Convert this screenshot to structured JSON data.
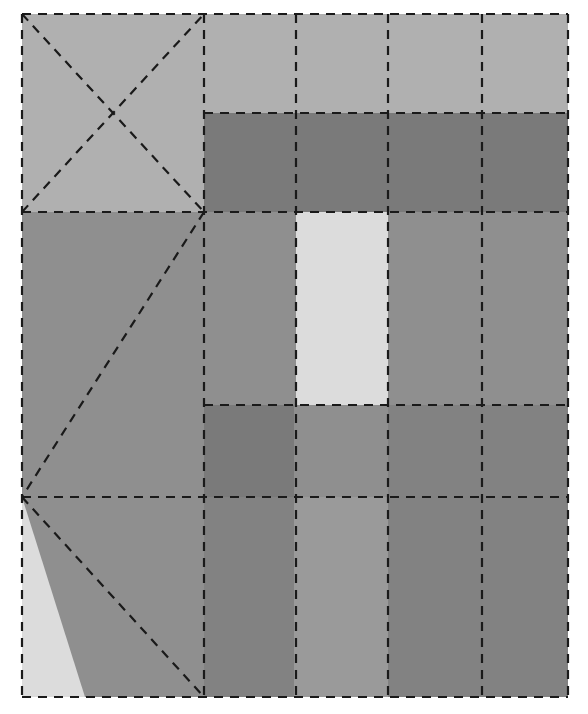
{
  "canvas": {
    "width": 588,
    "height": 714,
    "background": "#ffffff",
    "title": "Abstract grayscale rectangle partition diagram"
  },
  "palette": {
    "background": "#ffffff",
    "stroke": "#1a1a1a",
    "very_light": "#dcdcdc",
    "light": "#b0b0b0",
    "medium": "#8f8f8f",
    "medium_dark": "#828282",
    "dark": "#7a7a7a",
    "darker": "#767676"
  },
  "stroke": {
    "color": "#1a1a1a",
    "width": 2.2,
    "dash": "9 7",
    "style": "dashed"
  },
  "grid": {
    "left": 22,
    "right": 568,
    "top": 14,
    "bottom": 697,
    "vertical_lines": [
      22,
      204,
      296,
      388,
      482,
      568
    ],
    "horizontal_lines": [
      14,
      113,
      212,
      405,
      497,
      697
    ],
    "notes": "Dashed black guide lines partition the canvas into grayscale blocks."
  },
  "chart_data": {
    "type": "table",
    "xlabel": "",
    "ylabel": "",
    "grid": true,
    "legend": "none",
    "xlim": [
      22,
      568
    ],
    "ylim": [
      14,
      697
    ],
    "shapes": [
      {
        "name": "top-left-square",
        "kind": "rect",
        "x": 22,
        "y": 14,
        "w": 182,
        "h": 198,
        "fill": "#b0b0b0"
      },
      {
        "name": "top-strip-cell-1",
        "kind": "rect",
        "x": 204,
        "y": 14,
        "w": 92,
        "h": 99,
        "fill": "#b0b0b0"
      },
      {
        "name": "top-strip-cell-2",
        "kind": "rect",
        "x": 296,
        "y": 14,
        "w": 92,
        "h": 99,
        "fill": "#b0b0b0"
      },
      {
        "name": "top-strip-cell-3",
        "kind": "rect",
        "x": 388,
        "y": 14,
        "w": 94,
        "h": 99,
        "fill": "#b0b0b0"
      },
      {
        "name": "top-strip-cell-4",
        "kind": "rect",
        "x": 482,
        "y": 14,
        "w": 86,
        "h": 99,
        "fill": "#b0b0b0"
      },
      {
        "name": "dark-banner-band",
        "kind": "rect",
        "x": 204,
        "y": 113,
        "w": 364,
        "h": 99,
        "fill": "#7a7a7a"
      },
      {
        "name": "mid-left-large-block",
        "kind": "rect",
        "x": 22,
        "y": 212,
        "w": 182,
        "h": 285,
        "fill": "#8f8f8f"
      },
      {
        "name": "mid-column-left",
        "kind": "rect",
        "x": 204,
        "y": 212,
        "w": 92,
        "h": 193,
        "fill": "#8f8f8f"
      },
      {
        "name": "mid-column-highlight",
        "kind": "rect",
        "x": 296,
        "y": 212,
        "w": 92,
        "h": 193,
        "fill": "#dcdcdc"
      },
      {
        "name": "mid-column-right",
        "kind": "rect",
        "x": 388,
        "y": 212,
        "w": 180,
        "h": 193,
        "fill": "#8f8f8f"
      },
      {
        "name": "lower-band-left-cell",
        "kind": "rect",
        "x": 204,
        "y": 405,
        "w": 90,
        "h": 92,
        "fill": "#7a7a7a"
      },
      {
        "name": "lower-band-mid-cell",
        "kind": "rect",
        "x": 294,
        "y": 405,
        "w": 94,
        "h": 92,
        "fill": "#8f8f8f"
      },
      {
        "name": "lower-band-right-cell",
        "kind": "rect",
        "x": 388,
        "y": 405,
        "w": 180,
        "h": 92,
        "fill": "#828282"
      },
      {
        "name": "bottom-left-cell",
        "kind": "rect",
        "x": 22,
        "y": 497,
        "w": 182,
        "h": 200,
        "fill": "#dcdcdc"
      },
      {
        "name": "bottom-left-diagonal-wedge",
        "kind": "polygon",
        "points": "22,497 204,497 204,697 85,697",
        "fill": "#8f8f8f"
      },
      {
        "name": "bottom-column-left",
        "kind": "rect",
        "x": 204,
        "y": 497,
        "w": 90,
        "h": 200,
        "fill": "#828282"
      },
      {
        "name": "bottom-column-mid",
        "kind": "rect",
        "x": 294,
        "y": 497,
        "w": 94,
        "h": 200,
        "fill": "#9a9a9a"
      },
      {
        "name": "bottom-column-right",
        "kind": "rect",
        "x": 388,
        "y": 497,
        "w": 180,
        "h": 200,
        "fill": "#828282"
      }
    ],
    "guide_lines": [
      {
        "name": "diagonal-x-down-right",
        "x1": 22,
        "y1": 14,
        "x2": 204,
        "y2": 212
      },
      {
        "name": "diagonal-x-up-right",
        "x1": 22,
        "y1": 212,
        "x2": 204,
        "y2": 14
      },
      {
        "name": "diagonal-center-to-bottom-left",
        "x1": 204,
        "y1": 212,
        "x2": 22,
        "y2": 497
      },
      {
        "name": "diagonal-bottom-left-wedge",
        "x1": 22,
        "y1": 497,
        "x2": 204,
        "y2": 697
      }
    ]
  }
}
